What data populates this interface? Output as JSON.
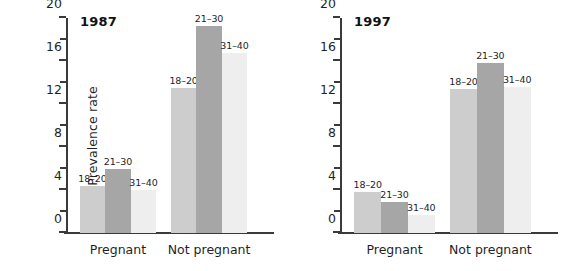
{
  "figure": {
    "width": 565,
    "height": 271,
    "background": "#ffffff"
  },
  "chart_data": {
    "type": "bar",
    "title": "",
    "xlabel": "",
    "ylabel": "Prevalence rate",
    "ylim": [
      0,
      20
    ],
    "yticks": [
      0,
      4,
      8,
      12,
      16,
      20
    ],
    "ytick_labels": [
      "0",
      "4",
      "8",
      "12",
      "16",
      "20"
    ],
    "yminor_ticks": [
      2,
      6,
      10,
      14,
      18
    ],
    "grid": false,
    "legend": "none (age groups annotated above bars)",
    "categories": [
      "Pregnant",
      "Not pregnant"
    ],
    "series": [
      {
        "name": "18-20",
        "label": "18–20",
        "color": "#cdcdcd",
        "panels": {
          "1987": {
            "Pregnant": 4.4,
            "Not pregnant": 13.5
          },
          "1997": {
            "Pregnant": 3.8,
            "Not pregnant": 13.4
          }
        }
      },
      {
        "name": "21-30",
        "label": "21–30",
        "color": "#a6a6a6",
        "panels": {
          "1987": {
            "Pregnant": 6.0,
            "Not pregnant": 19.3
          },
          "1997": {
            "Pregnant": 2.9,
            "Not pregnant": 15.8
          }
        }
      },
      {
        "name": "31-40",
        "label": "31–40",
        "color": "#eeeeee",
        "panels": {
          "1987": {
            "Pregnant": 4.0,
            "Not pregnant": 16.7
          },
          "1997": {
            "Pregnant": 1.7,
            "Not pregnant": 13.6
          }
        }
      }
    ],
    "panels": [
      {
        "id": "1987",
        "title": "1987",
        "show_ylabel": true,
        "groups": [
          {
            "category": "Pregnant",
            "bars": [
              {
                "series": "18-20",
                "label": "18–20",
                "value": 4.4,
                "color": "#cdcdcd"
              },
              {
                "series": "21-30",
                "label": "21–30",
                "value": 6.0,
                "color": "#a6a6a6"
              },
              {
                "series": "31-40",
                "label": "31–40",
                "value": 4.0,
                "color": "#eeeeee"
              }
            ]
          },
          {
            "category": "Not pregnant",
            "bars": [
              {
                "series": "18-20",
                "label": "18–20",
                "value": 13.5,
                "color": "#cdcdcd"
              },
              {
                "series": "21-30",
                "label": "21–30",
                "value": 19.3,
                "color": "#a6a6a6"
              },
              {
                "series": "31-40",
                "label": "31–40",
                "value": 16.7,
                "color": "#eeeeee"
              }
            ]
          }
        ]
      },
      {
        "id": "1997",
        "title": "1997",
        "show_ylabel": false,
        "groups": [
          {
            "category": "Pregnant",
            "bars": [
              {
                "series": "18-20",
                "label": "18–20",
                "value": 3.8,
                "color": "#cdcdcd"
              },
              {
                "series": "21-30",
                "label": "21–30",
                "value": 2.9,
                "color": "#a6a6a6"
              },
              {
                "series": "31-40",
                "label": "31–40",
                "value": 1.7,
                "color": "#eeeeee"
              }
            ]
          },
          {
            "category": "Not pregnant",
            "bars": [
              {
                "series": "18-20",
                "label": "18–20",
                "value": 13.4,
                "color": "#cdcdcd"
              },
              {
                "series": "21-30",
                "label": "21–30",
                "value": 15.8,
                "color": "#a6a6a6"
              },
              {
                "series": "31-40",
                "label": "31–40",
                "value": 13.6,
                "color": "#eeeeee"
              }
            ]
          }
        ]
      }
    ],
    "colors": {
      "axis": "#3a3a3a",
      "text": "#1f1f1f",
      "background": "#ffffff"
    }
  }
}
